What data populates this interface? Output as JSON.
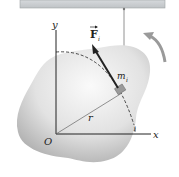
{
  "labels": {
    "y_axis": "y",
    "x_axis": "x",
    "origin": "O",
    "radius": "r",
    "mass": "m",
    "mass_subscript": "i",
    "force": "F",
    "force_subscript": "i",
    "angle_mark": "1"
  },
  "colors": {
    "ceiling": "#c9cdd0",
    "body_light": "#f2f2f2",
    "body_dark": "#b8b8b8",
    "rotation_arrow": "#9a9a9a",
    "axes": "#222222"
  }
}
